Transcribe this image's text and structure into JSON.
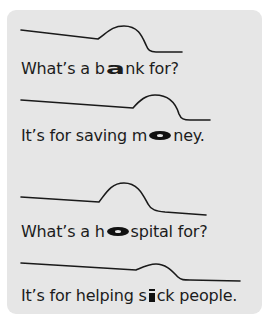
{
  "colors": {
    "background": "#ffffff",
    "panel": "#e6e6e6",
    "text": "#1c1c1c",
    "curve": "#1a1a1a"
  },
  "sentences": [
    {
      "before": "What’s a b",
      "stressed": "a",
      "after": "nk for?",
      "stress_style": "wide-bold-letter"
    },
    {
      "before": "It’s for saving m",
      "stressed": "o",
      "after": "ney.",
      "stress_style": "wide-oval"
    },
    {
      "before": "What’s a h",
      "stressed": "o",
      "after": "spital for?",
      "stress_style": "wide-oval"
    },
    {
      "before": "It’s for helping s",
      "stressed": "i",
      "after": "ck people.",
      "stress_style": "fat-letter"
    }
  ],
  "intonation_curves": [
    {
      "for_sentence": 1,
      "shape": "fall-rise-fall",
      "d": "M21,30 L98,39 C108,32 112,26 124,26 C138,26 142,36 146,45 C148,50 150,52 156,52 L182,52"
    },
    {
      "for_sentence": 2,
      "shape": "fall-rise-fall",
      "d": "M21,100 L133,108 C140,100 146,95 155,95 C170,95 176,104 179,114 C181,119 184,120 190,120 L210,120"
    },
    {
      "for_sentence": 3,
      "shape": "fall-rise-fall",
      "d": "M21,197 L99,202 C106,193 111,183 124,183 C138,183 143,195 148,204 C151,210 156,211 165,212 L206,215"
    },
    {
      "for_sentence": 4,
      "shape": "fall-rise-fall",
      "d": "M21,263 L136,270 C143,267 149,264 156,264 C166,264 172,271 178,277 C181,280 184,280 190,280 L240,281"
    }
  ]
}
